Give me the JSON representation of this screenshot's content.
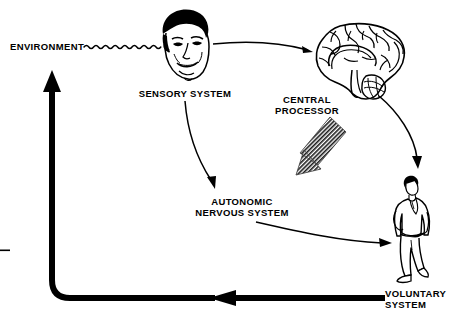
{
  "diagram": {
    "background_color": "#ffffff",
    "ink_color": "#000000",
    "labels": {
      "environment": "ENVIRONMENT",
      "sensory_system": "SENSORY SYSTEM",
      "central_processor_line1": "CENTRAL",
      "central_processor_line2": "PROCESSOR",
      "autonomic_line1": "AUTONOMIC",
      "autonomic_line2": "NERVOUS SYSTEM",
      "voluntary_line1": "VOLUNTARY",
      "voluntary_line2": "SYSTEM"
    },
    "nodes": [
      {
        "id": "environment",
        "label": "ENVIRONMENT",
        "icon": "text-label",
        "x": 10,
        "y": 40
      },
      {
        "id": "sensory-system",
        "label": "SENSORY SYSTEM",
        "icon": "human-face-icon",
        "x": 158,
        "y": 10
      },
      {
        "id": "central-processor",
        "label": "CENTRAL PROCESSOR",
        "icon": "brain-icon",
        "x": 310,
        "y": 25
      },
      {
        "id": "autonomic-nervous-system",
        "label": "AUTONOMIC NERVOUS SYSTEM",
        "icon": "text-label",
        "x": 186,
        "y": 196
      },
      {
        "id": "voluntary-system",
        "label": "VOLUNTARY SYSTEM",
        "icon": "walking-man-icon",
        "x": 395,
        "y": 175
      }
    ],
    "connections": [
      {
        "id": "environment-to-sensory",
        "from": "environment",
        "to": "sensory-system",
        "style": "wavy",
        "label": ""
      },
      {
        "id": "sensory-to-central",
        "from": "sensory-system",
        "to": "central-processor",
        "style": "thin-arrow",
        "label": ""
      },
      {
        "id": "sensory-to-autonomic",
        "from": "sensory-system",
        "to": "autonomic-nervous-system",
        "style": "thin-curved-arrow",
        "label": ""
      },
      {
        "id": "central-to-autonomic",
        "from": "central-processor",
        "to": "autonomic-nervous-system",
        "style": "thick-hatched-arrow",
        "label": ""
      },
      {
        "id": "central-to-voluntary",
        "from": "central-processor",
        "to": "voluntary-system",
        "style": "thin-curved-arrow",
        "label": ""
      },
      {
        "id": "autonomic-to-voluntary",
        "from": "autonomic-nervous-system",
        "to": "voluntary-system",
        "style": "thin-curved-arrow",
        "label": ""
      },
      {
        "id": "voluntary-to-environment",
        "from": "voluntary-system",
        "to": "environment",
        "style": "thick-feedback-arrow",
        "label": ""
      }
    ]
  }
}
